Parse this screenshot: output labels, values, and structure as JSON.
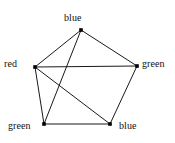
{
  "figure": {
    "name": "graph-coloring-pentagon",
    "background_color": "#ffffff",
    "edge_color": "#1a1a1a",
    "vertex_color": "#000000",
    "label_color": "#111111",
    "width": 175,
    "height": 143
  },
  "vertices": [
    {
      "id": "top",
      "label": "blue",
      "x": 81,
      "y": 30,
      "label_x": 64,
      "label_y": 12
    },
    {
      "id": "left",
      "label": "red",
      "x": 35,
      "y": 67,
      "label_x": 4,
      "label_y": 58
    },
    {
      "id": "right",
      "label": "green",
      "x": 137,
      "y": 66,
      "label_x": 142,
      "label_y": 58
    },
    {
      "id": "bottomleft",
      "label": "green",
      "x": 44,
      "y": 124,
      "label_x": 8,
      "label_y": 120
    },
    {
      "id": "bottomright",
      "label": "blue",
      "x": 110,
      "y": 124,
      "label_x": 119,
      "label_y": 120
    }
  ],
  "edges": [
    {
      "from": "top",
      "to": "left"
    },
    {
      "from": "top",
      "to": "right"
    },
    {
      "from": "top",
      "to": "bottomleft"
    },
    {
      "from": "left",
      "to": "right"
    },
    {
      "from": "left",
      "to": "bottomleft"
    },
    {
      "from": "left",
      "to": "bottomright"
    },
    {
      "from": "right",
      "to": "bottomright"
    },
    {
      "from": "bottomleft",
      "to": "bottomright"
    }
  ]
}
